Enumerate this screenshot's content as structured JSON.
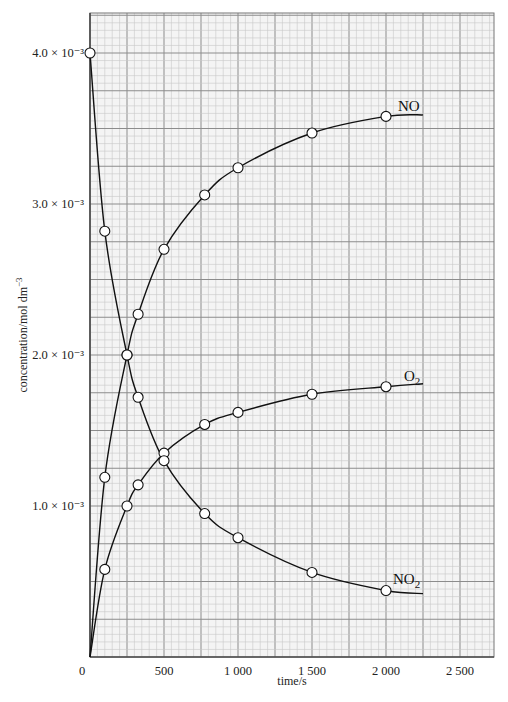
{
  "chart_data": {
    "type": "line",
    "title": "",
    "xlabel": "time/s",
    "ylabel": "concentration/mol dm⁻³",
    "xlim": [
      0,
      2730
    ],
    "ylim": [
      0,
      0.0043
    ],
    "grid": true,
    "x_ticks": [
      {
        "value": 0,
        "label": "0"
      },
      {
        "value": 500,
        "label": "500"
      },
      {
        "value": 1000,
        "label": "1 000"
      },
      {
        "value": 1500,
        "label": "1 500"
      },
      {
        "value": 2000,
        "label": "2 000"
      },
      {
        "value": 2500,
        "label": "2 500"
      }
    ],
    "y_ticks": [
      {
        "value": 0.001,
        "label": "1.0 × 10⁻³"
      },
      {
        "value": 0.002,
        "label": "2.0 × 10⁻³"
      },
      {
        "value": 0.003,
        "label": "3.0 × 10⁻³"
      },
      {
        "value": 0.004,
        "label": "4.0 × 10⁻³"
      }
    ],
    "series": [
      {
        "name": "NO",
        "label": "NO",
        "markers": [
          [
            0,
            0
          ],
          [
            100,
            0.00119
          ],
          [
            250,
            0.002
          ],
          [
            325,
            0.00227
          ],
          [
            500,
            0.0027
          ],
          [
            775,
            0.00306
          ],
          [
            1000,
            0.00324
          ],
          [
            1500,
            0.00347
          ],
          [
            2000,
            0.00358
          ]
        ],
        "curve_end": [
          2250,
          0.00359
        ]
      },
      {
        "name": "O2",
        "label": "O₂",
        "markers": [
          [
            100,
            0.00058
          ],
          [
            250,
            0.001
          ],
          [
            325,
            0.00114
          ],
          [
            500,
            0.00135
          ],
          [
            775,
            0.00154
          ],
          [
            1000,
            0.00162
          ],
          [
            1500,
            0.00174
          ],
          [
            2000,
            0.00179
          ]
        ],
        "curve_start": [
          0,
          0
        ],
        "curve_end": [
          2250,
          0.00181
        ]
      },
      {
        "name": "NO2",
        "label": "NO₂",
        "markers": [
          [
            0,
            0.004
          ],
          [
            100,
            0.00282
          ],
          [
            250,
            0.002
          ],
          [
            325,
            0.00172
          ],
          [
            500,
            0.0013
          ],
          [
            775,
            0.00095
          ],
          [
            1000,
            0.00079
          ],
          [
            1500,
            0.00056
          ],
          [
            2000,
            0.00044
          ]
        ],
        "curve_end": [
          2250,
          0.00042
        ]
      }
    ],
    "annotations": [
      {
        "text": "NO",
        "series": "NO"
      },
      {
        "text": "O₂",
        "series": "O2"
      },
      {
        "text": "NO₂",
        "series": "NO2"
      }
    ]
  },
  "labels": {
    "xlabel": "time/s",
    "ylabel_main": "concentration/mol dm",
    "ylabel_sup": "−3",
    "series_NO": "NO",
    "series_O2_main": "O",
    "series_O2_sub": "2",
    "series_NO2_main": "NO",
    "series_NO2_sub": "2"
  },
  "colors": {
    "minor_grid": "#c8c8c8",
    "major_grid": "#8c8c8c",
    "background": "#f4f4f4",
    "line": "#111111",
    "marker_fill": "#ffffff"
  }
}
